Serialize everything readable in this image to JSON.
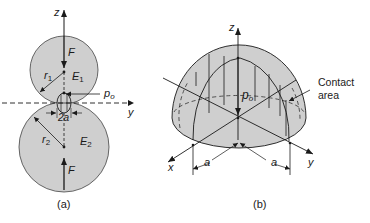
{
  "figure": {
    "panel_a": {
      "caption": "(a)",
      "axis_z": "z",
      "axis_y": "y",
      "force_top": "F",
      "force_bottom": "F",
      "radius_1": "r",
      "radius_1_sub": "1",
      "radius_2": "r",
      "radius_2_sub": "2",
      "modulus_1": "E",
      "modulus_1_sub": "1",
      "modulus_2": "E",
      "modulus_2_sub": "2",
      "pressure": "p",
      "pressure_sub": "o",
      "contact_width": "2a"
    },
    "panel_b": {
      "caption": "(b)",
      "axis_z": "z",
      "axis_x": "x",
      "axis_y": "y",
      "pressure": "p",
      "pressure_sub": "o",
      "half_width_left": "a",
      "half_width_right": "a",
      "contact_label_line1": "Contact",
      "contact_label_line2": "area"
    },
    "colors": {
      "fill": "#cfcfcf",
      "stroke": "#1a1a1a"
    }
  }
}
